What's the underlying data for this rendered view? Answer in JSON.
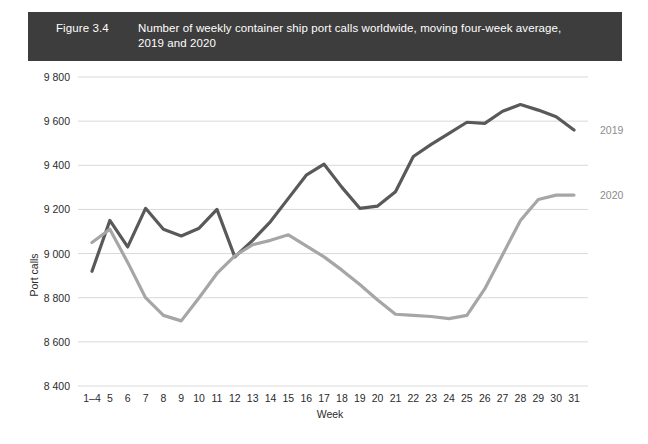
{
  "figure": {
    "number": "Figure 3.4",
    "title_line1": "Number of weekly container ship port calls worldwide, moving four-week average,",
    "title_line2": "2019 and 2020",
    "title_bar_color": "#3d3d3d",
    "title_text_color": "#ffffff"
  },
  "colors": {
    "series_2019": "#595959",
    "series_2020": "#a6a6a6",
    "gridline": "#d9d9d9",
    "text": "#2b2b2b",
    "legend_text": "#8c8c8c"
  },
  "axes": {
    "y_label": "Port calls",
    "x_label": "Week",
    "y_ticks": [
      "9 800",
      "9 600",
      "9 400",
      "9 200",
      "9 000",
      "8 800",
      "8 600",
      "8 400"
    ],
    "x_ticks": [
      "1–4",
      "5",
      "6",
      "7",
      "8",
      "9",
      "10",
      "11",
      "12",
      "13",
      "14",
      "15",
      "16",
      "17",
      "18",
      "19",
      "20",
      "21",
      "22",
      "23",
      "24",
      "25",
      "26",
      "27",
      "28",
      "29",
      "30",
      "31"
    ]
  },
  "legend": {
    "items": [
      {
        "label": "2019",
        "color": "#595959"
      },
      {
        "label": "2020",
        "color": "#a6a6a6"
      }
    ]
  },
  "chart_data": {
    "type": "line",
    "title": "Number of weekly container ship port calls worldwide, moving four-week average, 2019 and 2020",
    "xlabel": "Week",
    "ylabel": "Port calls",
    "ylim": [
      8400,
      9800
    ],
    "ytick_step": 200,
    "grid": true,
    "legend_position": "right",
    "categories": [
      "1–4",
      "5",
      "6",
      "7",
      "8",
      "9",
      "10",
      "11",
      "12",
      "13",
      "14",
      "15",
      "16",
      "17",
      "18",
      "19",
      "20",
      "21",
      "22",
      "23",
      "24",
      "25",
      "26",
      "27",
      "28",
      "29",
      "30",
      "31"
    ],
    "series": [
      {
        "name": "2019",
        "color": "#595959",
        "values": [
          8920,
          9150,
          9030,
          9205,
          9110,
          9080,
          9115,
          9200,
          8985,
          9060,
          9145,
          9250,
          9355,
          9405,
          9300,
          9205,
          9215,
          9280,
          9440,
          9495,
          9545,
          9595,
          9590,
          9645,
          9675,
          9650,
          9620,
          9560
        ]
      },
      {
        "name": "2020",
        "color": "#a6a6a6",
        "values": [
          9050,
          9110,
          8960,
          8800,
          8720,
          8695,
          8800,
          8910,
          8990,
          9040,
          9060,
          9085,
          9035,
          8985,
          8925,
          8860,
          8790,
          8725,
          8720,
          8715,
          8705,
          8720,
          8840,
          8995,
          9150,
          9245,
          9265,
          9265
        ]
      }
    ]
  }
}
